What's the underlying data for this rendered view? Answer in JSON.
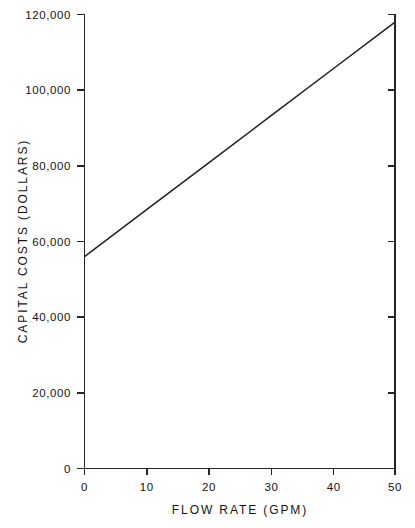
{
  "chart_data": {
    "type": "line",
    "title": "",
    "xlabel": "FLOW RATE (GPM)",
    "ylabel": "CAPITAL COSTS (DOLLARS)",
    "xlim": [
      0,
      50
    ],
    "ylim": [
      0,
      120000
    ],
    "grid": false,
    "legend": "none",
    "xticks": [
      0,
      10,
      20,
      30,
      40,
      50
    ],
    "yticks": [
      0,
      20000,
      40000,
      60000,
      80000,
      100000,
      120000
    ],
    "xtick_labels": [
      "0",
      "10",
      "20",
      "30",
      "40",
      "50"
    ],
    "ytick_labels": [
      "0",
      "20,000",
      "40,000",
      "60,000",
      "80,000",
      "100,000",
      "120,000"
    ],
    "series": [
      {
        "name": "Capital Costs",
        "x": [
          0,
          10,
          20,
          30,
          40,
          50
        ],
        "values": [
          56000,
          68400,
          80800,
          93200,
          105600,
          118000
        ],
        "color": "#1f1f1f"
      }
    ]
  },
  "axes": {
    "y_title": "CAPITAL COSTS (DOLLARS)",
    "x_title": "FLOW RATE (GPM)"
  },
  "colors": {
    "line": "#1f1f1f",
    "axis": "#262626",
    "background": "#ffffff",
    "text": "#131313"
  }
}
